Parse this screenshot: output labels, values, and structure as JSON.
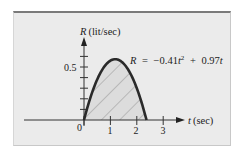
{
  "chart_data": {
    "type": "area",
    "title": "",
    "equation": "R = −0.41t² + 0.97t",
    "equation_parts": {
      "lhs": "R",
      "eq": "=",
      "a": "−0.41",
      "var1": "t",
      "exp": "2",
      "plus": "+",
      "b": "0.97",
      "var2": "t"
    },
    "coefficients": {
      "a": -0.41,
      "b": 0.97,
      "c": 0
    },
    "xlabel": "t (sec)",
    "xlabel_var": "t",
    "xlabel_unit": "(sec)",
    "ylabel": "R (lit/sec)",
    "ylabel_var": "R",
    "ylabel_unit": "(lit/sec)",
    "x_ticks": [
      0,
      1,
      2,
      3
    ],
    "x_tick_labels": [
      "0",
      "1",
      "2",
      "3"
    ],
    "y_ticks": [
      0.1,
      0.2,
      0.3,
      0.4,
      0.5,
      0.6
    ],
    "y_tick_labels": [
      "0.5"
    ],
    "xlim": [
      -2.3,
      3.6
    ],
    "ylim": [
      0,
      0.75
    ],
    "roots": [
      0,
      2.37
    ],
    "peak": {
      "t": 1.18,
      "R": 0.574
    },
    "shaded_region": {
      "from": 0,
      "to": 2.37,
      "pattern": "diagonal-hatch"
    },
    "x": [
      0,
      0.25,
      0.5,
      0.75,
      1.0,
      1.18,
      1.25,
      1.5,
      1.75,
      2.0,
      2.25,
      2.37
    ],
    "values": [
      0,
      0.217,
      0.383,
      0.497,
      0.56,
      0.574,
      0.572,
      0.533,
      0.442,
      0.3,
      0.107,
      0
    ],
    "grid": false,
    "legend": "none"
  },
  "labels": {
    "origin": "0",
    "tick_1": "1",
    "tick_2": "2",
    "tick_3": "3",
    "y_tick_05": "0.5"
  }
}
